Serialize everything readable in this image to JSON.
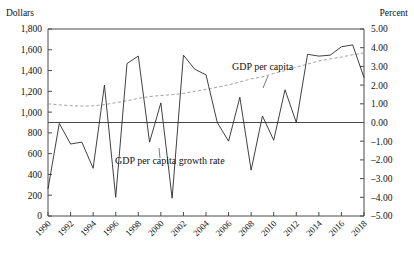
{
  "chart_data": {
    "type": "line",
    "title": "",
    "subtitle": "",
    "xlabel": "",
    "grid": false,
    "legend_position": "inline-annotations",
    "x": [
      1990,
      1991,
      1992,
      1993,
      1994,
      1995,
      1996,
      1997,
      1998,
      1999,
      2000,
      2001,
      2002,
      2003,
      2004,
      2005,
      2006,
      2007,
      2008,
      2009,
      2010,
      2011,
      2012,
      2013,
      2014,
      2015,
      2016,
      2017,
      2018
    ],
    "xtick_labels": [
      "1990",
      "1992",
      "1994",
      "1996",
      "1998",
      "2000",
      "2002",
      "2004",
      "2006",
      "2008",
      "2010",
      "2012",
      "2014",
      "2016",
      "2018"
    ],
    "xtick_values": [
      1990,
      1992,
      1994,
      1996,
      1998,
      2000,
      2002,
      2004,
      2006,
      2008,
      2010,
      2012,
      2014,
      2016,
      2018
    ],
    "xlim": [
      1990,
      2018
    ],
    "left_axis": {
      "label": "Dollars",
      "ylim": [
        0,
        1800
      ],
      "ticks": [
        0,
        200,
        400,
        600,
        800,
        1000,
        1200,
        1400,
        1600,
        1800
      ],
      "tick_labels": [
        "0",
        "200",
        "400",
        "600",
        "800",
        "1,000",
        "1,200",
        "1,400",
        "1,600",
        "1,800"
      ]
    },
    "right_axis": {
      "label": "Percent",
      "ylim": [
        -5,
        5
      ],
      "ticks": [
        -5,
        -4,
        -3,
        -2,
        -1,
        0,
        1,
        2,
        3,
        4,
        5
      ],
      "tick_labels": [
        "-5.00",
        "-4.00",
        "-3.00",
        "-2.00",
        "-1.00",
        "0.00",
        "1.00",
        "2.00",
        "3.00",
        "4.00",
        "5.00"
      ]
    },
    "series": [
      {
        "name": "GDP per capita",
        "axis": "left",
        "unit": "Dollars",
        "style": "dashed",
        "color": "#9a9a9a",
        "annotation": "GDP per capita",
        "values": [
          1080,
          1070,
          1062,
          1058,
          1060,
          1072,
          1090,
          1110,
          1132,
          1150,
          1160,
          1168,
          1180,
          1200,
          1218,
          1240,
          1262,
          1290,
          1320,
          1340,
          1372,
          1400,
          1432,
          1462,
          1492,
          1512,
          1530,
          1552,
          1570
        ]
      },
      {
        "name": "GDP per capita growth rate",
        "axis": "right",
        "unit": "Percent",
        "style": "solid",
        "color": "#2b2b2b",
        "annotation": "GDP per capita growth rate",
        "values": [
          -3.55,
          -0.05,
          -1.15,
          -1.05,
          -2.45,
          2.0,
          -4.0,
          3.15,
          3.55,
          -1.05,
          1.05,
          -4.05,
          3.6,
          2.85,
          2.55,
          0.0,
          -1.0,
          1.35,
          -2.55,
          0.35,
          -0.95,
          1.75,
          0.0,
          3.65,
          3.55,
          3.6,
          4.05,
          4.15,
          2.4
        ]
      }
    ],
    "annotations": [
      {
        "text": "GDP per capita",
        "x_px": 232,
        "y_px": 70
      },
      {
        "text": "GDP per capita growth rate",
        "x_px": 115,
        "y_px": 164
      }
    ]
  },
  "axes": {
    "left_title": "Dollars",
    "right_title": "Percent"
  }
}
